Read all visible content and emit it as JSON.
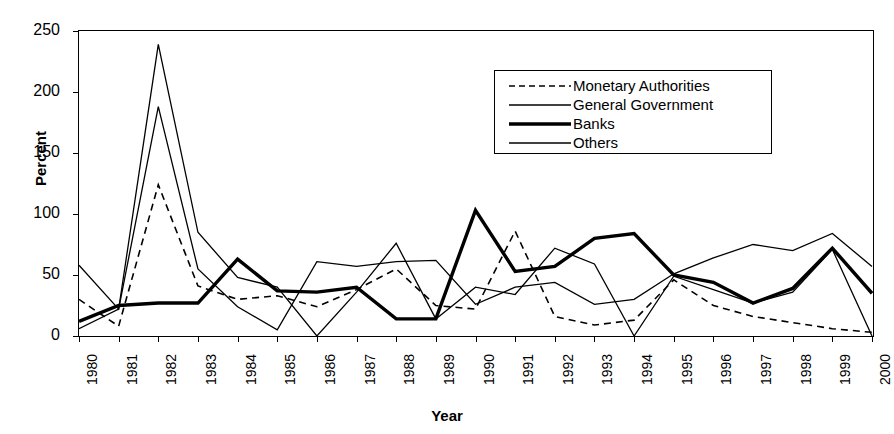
{
  "chart_data": {
    "type": "line",
    "title": "",
    "xlabel": "Year",
    "ylabel": "Percent",
    "ylim": [
      0,
      250
    ],
    "yticks": [
      0,
      50,
      100,
      150,
      200,
      250
    ],
    "grid": false,
    "legend_position": "top-right-inside",
    "categories": [
      "1980",
      "1981",
      "1982",
      "1983",
      "1984",
      "1985",
      "1986",
      "1987",
      "1988",
      "1989",
      "1990",
      "1991",
      "1992",
      "1993",
      "1994",
      "1995",
      "1996",
      "1997",
      "1998",
      "1999",
      "2000"
    ],
    "series": [
      {
        "name": "Monetary Authorities",
        "style": "dashed",
        "width": 1.6,
        "color": "#000000",
        "values": [
          30,
          8,
          124,
          41,
          30,
          33,
          24,
          38,
          55,
          25,
          22,
          86,
          16,
          9,
          13,
          46,
          25,
          16,
          11,
          6,
          3
        ]
      },
      {
        "name": "General Government",
        "style": "solid",
        "width": 1.3,
        "color": "#000000",
        "values": [
          6,
          22,
          239,
          85,
          48,
          40,
          0,
          36,
          76,
          14,
          40,
          34,
          72,
          59,
          0,
          49,
          38,
          27,
          36,
          71,
          0
        ]
      },
      {
        "name": "Banks",
        "style": "solid",
        "width": 3.4,
        "color": "#000000",
        "values": [
          12,
          25,
          27,
          27,
          63,
          37,
          36,
          40,
          14,
          14,
          103,
          53,
          57,
          80,
          84,
          50,
          44,
          27,
          39,
          72,
          35
        ]
      },
      {
        "name": "Others",
        "style": "solid",
        "width": 1.3,
        "color": "#000000",
        "values": [
          58,
          22,
          188,
          55,
          24,
          5,
          61,
          57,
          61,
          62,
          26,
          40,
          44,
          26,
          30,
          51,
          64,
          75,
          70,
          84,
          57
        ]
      }
    ]
  },
  "axes": {
    "y_tick_labels": [
      "250",
      "200",
      "150",
      "100",
      "50",
      "0"
    ],
    "x_tick_labels": [
      "1980",
      "1981",
      "1982",
      "1983",
      "1984",
      "1985",
      "1986",
      "1987",
      "1988",
      "1989",
      "1990",
      "1991",
      "1992",
      "1993",
      "1994",
      "1995",
      "1996",
      "1997",
      "1998",
      "1999",
      "2000"
    ],
    "y_axis_title": "Percent",
    "x_axis_title": "Year"
  },
  "legend": {
    "entries": [
      {
        "label": "Monetary  Authorities",
        "swatch": "dashed-line-swatch"
      },
      {
        "label": "General Government",
        "swatch": "thin-line-swatch"
      },
      {
        "label": "Banks",
        "swatch": "thick-line-swatch"
      },
      {
        "label": "Others",
        "swatch": "thin-line-swatch"
      }
    ]
  }
}
